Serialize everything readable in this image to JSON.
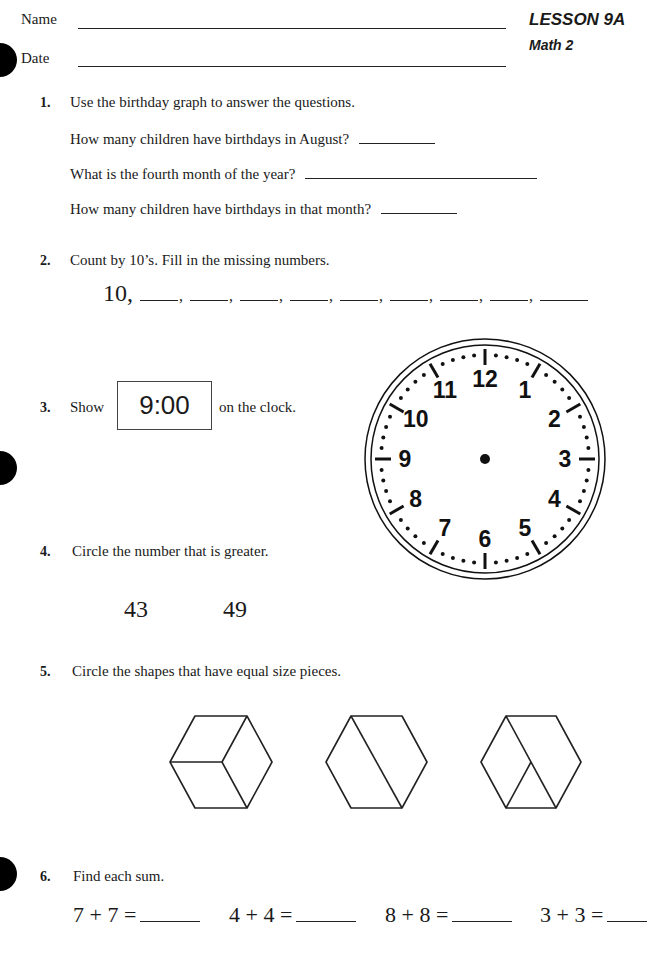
{
  "header": {
    "name_label": "Name",
    "date_label": "Date",
    "lesson": "LESSON 9A",
    "subject": "Math 2"
  },
  "questions": [
    {
      "number": "1.",
      "prompt": "Use the birthday graph to answer the questions.",
      "sub": [
        "How many children have birthdays in August?",
        "What is the fourth month of the year?",
        "How many children have birthdays in that month?"
      ]
    },
    {
      "number": "2.",
      "prompt": "Count by 10’s. Fill in the missing numbers.",
      "start": "10,",
      "blank_count": 9
    },
    {
      "number": "3.",
      "prompt_before": "Show",
      "time": "9:00",
      "prompt_after": "on the clock."
    },
    {
      "number": "4.",
      "prompt": "Circle the number that is greater.",
      "options": [
        "43",
        "49"
      ]
    },
    {
      "number": "5.",
      "prompt": "Circle the shapes that have equal size pieces.",
      "shapes": [
        "hexagon-three-rhombi",
        "hexagon-two-trapezoids",
        "hexagon-unequal-parts"
      ]
    },
    {
      "number": "6.",
      "prompt": "Find each sum.",
      "sums": [
        "7 + 7 =",
        "4 + 4 =",
        "8 + 8 =",
        "3 + 3 ="
      ]
    }
  ],
  "clock": {
    "numbers": [
      "12",
      "1",
      "2",
      "3",
      "4",
      "5",
      "6",
      "7",
      "8",
      "9",
      "10",
      "11"
    ]
  }
}
